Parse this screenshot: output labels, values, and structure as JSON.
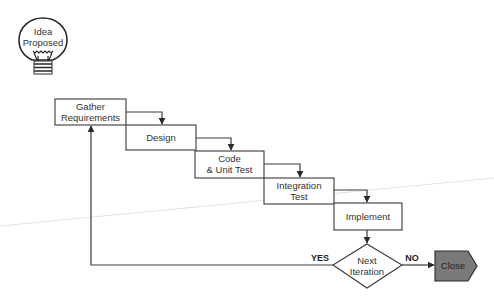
{
  "diagram": {
    "type": "waterfall-flowchart",
    "start": {
      "label_line1": "Idea",
      "label_line2": "Proposed",
      "icon": "lightbulb-icon"
    },
    "steps": [
      {
        "id": "gather",
        "line1": "Gather",
        "line2": "Requirements"
      },
      {
        "id": "design",
        "line1": "Design",
        "line2": ""
      },
      {
        "id": "code",
        "line1": "Code",
        "line2": "& Unit Test"
      },
      {
        "id": "integration",
        "line1": "Integration",
        "line2": "Test"
      },
      {
        "id": "implement",
        "line1": "Implement",
        "line2": ""
      }
    ],
    "decision": {
      "line1": "Next",
      "line2": "Iteration"
    },
    "branches": {
      "yes": "YES",
      "no": "NO"
    },
    "end": {
      "label": "Close",
      "fill": "#7a7a7a"
    }
  }
}
